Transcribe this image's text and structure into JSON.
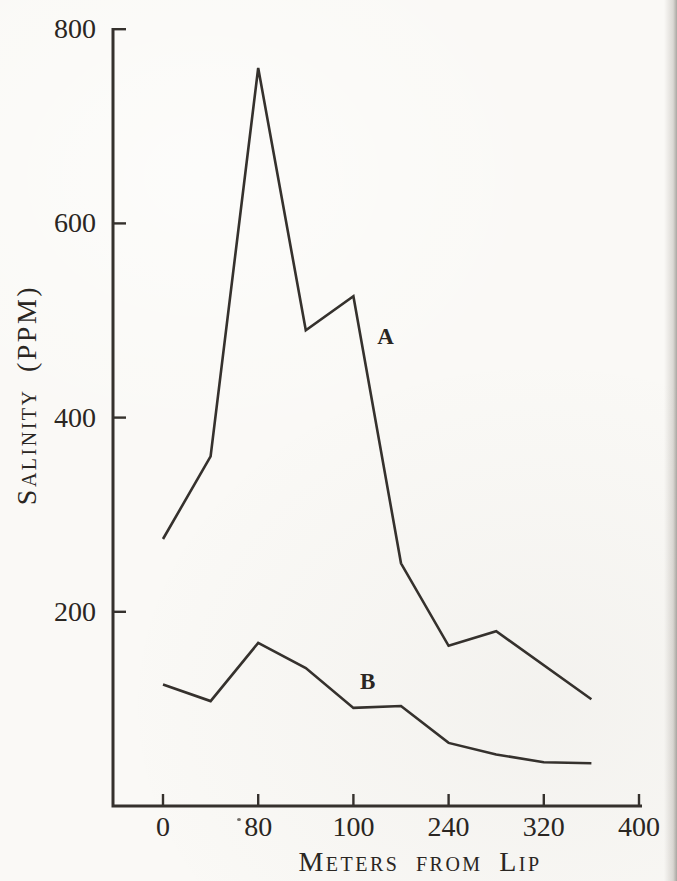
{
  "figure": {
    "paper_color": "#faf9f6",
    "ink_color": "#35312d",
    "text_color": "#2a2622"
  },
  "chart_data": {
    "type": "line",
    "title": "",
    "xlabel": "Meters from Lip",
    "ylabel": "Salinity (PPM)",
    "xlim": [
      0,
      400
    ],
    "ylim": [
      0,
      800
    ],
    "grid": false,
    "legend_position": "inline-labels",
    "x_tick_values": [
      0,
      80,
      160,
      240,
      320,
      400
    ],
    "x_tick_labels": [
      "0",
      "80",
      "100",
      "240",
      "320",
      "400"
    ],
    "y_tick_values": [
      800,
      600,
      400,
      200
    ],
    "y_tick_labels": [
      "800",
      "600",
      "400",
      "200"
    ],
    "series": [
      {
        "name": "A",
        "label": "A",
        "x": [
          0,
          40,
          80,
          120,
          160,
          200,
          240,
          280,
          360
        ],
        "y": [
          275,
          360,
          760,
          490,
          525,
          250,
          165,
          180,
          110
        ],
        "label_anchor": {
          "x_m": 187,
          "y_ppm": 483
        }
      },
      {
        "name": "B",
        "label": "B",
        "x": [
          0,
          40,
          80,
          120,
          160,
          200,
          240,
          280,
          320,
          360
        ],
        "y": [
          125,
          108,
          168,
          142,
          101,
          103,
          65,
          53,
          45,
          44
        ],
        "label_anchor": {
          "x_m": 172,
          "y_ppm": 128
        }
      }
    ]
  }
}
